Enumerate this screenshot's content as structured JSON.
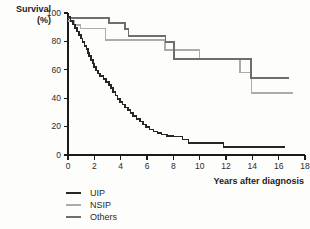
{
  "figure": {
    "background": "#fdfdfc"
  },
  "chart_data": {
    "type": "line",
    "subtype": "kaplan-meier-step",
    "title": "",
    "ylabel": "Survival (%)",
    "ylabel_lines": [
      "Survival",
      "(%)"
    ],
    "xlabel": "Years after diagnosis",
    "xlim": [
      0,
      18
    ],
    "ylim": [
      0,
      100
    ],
    "x_ticks": [
      0,
      2,
      4,
      6,
      8,
      10,
      12,
      14,
      16,
      18
    ],
    "y_ticks": [
      0,
      20,
      40,
      60,
      80,
      100
    ],
    "grid": false,
    "legend_position": "bottom-left",
    "axis_color": "#1a1a1a",
    "tick_label_color": "#2b2b2b",
    "series": [
      {
        "name": "NSIP",
        "color": "#ababab",
        "stroke_width": 1.5,
        "points": [
          [
            0,
            94.5
          ],
          [
            0.5,
            91.5
          ],
          [
            0.95,
            89
          ],
          [
            2.85,
            81
          ],
          [
            7.35,
            74
          ],
          [
            10.0,
            67.5
          ],
          [
            13.05,
            58
          ],
          [
            13.95,
            43.5
          ],
          [
            17.1,
            43.5
          ]
        ]
      },
      {
        "name": "Others",
        "color": "#6e6e6e",
        "stroke_width": 1.7,
        "points": [
          [
            0,
            96.5
          ],
          [
            3.1,
            93
          ],
          [
            4.35,
            88.5
          ],
          [
            4.6,
            84
          ],
          [
            7.4,
            79.5
          ],
          [
            8.05,
            67.5
          ],
          [
            13.9,
            54
          ],
          [
            16.8,
            54
          ]
        ]
      },
      {
        "name": "UIP",
        "color": "#262626",
        "stroke_width": 1.7,
        "points": [
          [
            0,
            97
          ],
          [
            0.2,
            94.5
          ],
          [
            0.4,
            92
          ],
          [
            0.55,
            89.5
          ],
          [
            0.7,
            87
          ],
          [
            0.85,
            84.5
          ],
          [
            1.0,
            82
          ],
          [
            1.1,
            79.5
          ],
          [
            1.25,
            77
          ],
          [
            1.4,
            74.5
          ],
          [
            1.5,
            72
          ],
          [
            1.6,
            69.5
          ],
          [
            1.75,
            67
          ],
          [
            1.9,
            64.5
          ],
          [
            2.0,
            62
          ],
          [
            2.15,
            59.5
          ],
          [
            2.3,
            57.5
          ],
          [
            2.45,
            55.5
          ],
          [
            2.7,
            53.5
          ],
          [
            2.9,
            51.5
          ],
          [
            3.1,
            49.5
          ],
          [
            3.25,
            47
          ],
          [
            3.4,
            44.5
          ],
          [
            3.6,
            42
          ],
          [
            3.75,
            39.5
          ],
          [
            3.95,
            37.5
          ],
          [
            4.15,
            35.5
          ],
          [
            4.35,
            33.5
          ],
          [
            4.55,
            31.5
          ],
          [
            4.75,
            29.5
          ],
          [
            4.95,
            27.5
          ],
          [
            5.2,
            25.5
          ],
          [
            5.45,
            23.5
          ],
          [
            5.7,
            21.5
          ],
          [
            5.95,
            19.5
          ],
          [
            6.2,
            18
          ],
          [
            6.5,
            16.5
          ],
          [
            6.8,
            15.5
          ],
          [
            7.1,
            14.5
          ],
          [
            7.5,
            13.5
          ],
          [
            8.0,
            13
          ],
          [
            8.7,
            11
          ],
          [
            9.15,
            8.5
          ],
          [
            11.8,
            5.5
          ],
          [
            16.5,
            5.5
          ]
        ]
      }
    ]
  },
  "legend": {
    "items": [
      {
        "label": "UIP",
        "series": "UIP"
      },
      {
        "label": "NSIP",
        "series": "NSIP"
      },
      {
        "label": "Others",
        "series": "Others"
      }
    ]
  },
  "layout_values": {
    "plot_left_px": 68,
    "plot_right_px": 305,
    "plot_top_px": 13,
    "plot_bottom_px": 155
  }
}
